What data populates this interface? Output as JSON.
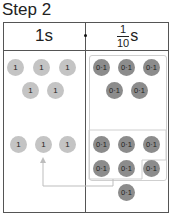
{
  "title": "Step 2",
  "table": {
    "headers": {
      "left": "1s",
      "right": {
        "numerator": "1",
        "denominator": "10",
        "unit": "s"
      }
    },
    "left_column": {
      "top_group": [
        "1",
        "1",
        "1",
        "1",
        "1"
      ],
      "bottom_group": [
        "1",
        "1",
        "1"
      ]
    },
    "right_column": {
      "top_group": [
        "0·1",
        "0·1",
        "0·1",
        "0·1",
        "0·1"
      ],
      "bottom_group": [
        "0·1",
        "0·1",
        "0·1",
        "0·1",
        "0·1",
        "0·1",
        "0·1"
      ]
    }
  },
  "colors": {
    "ones_counter": "#c4c4c4",
    "tenths_counter": "#8c8c8c",
    "group_outline": "#cfcfcf",
    "arrow": "#bdbdbd"
  }
}
